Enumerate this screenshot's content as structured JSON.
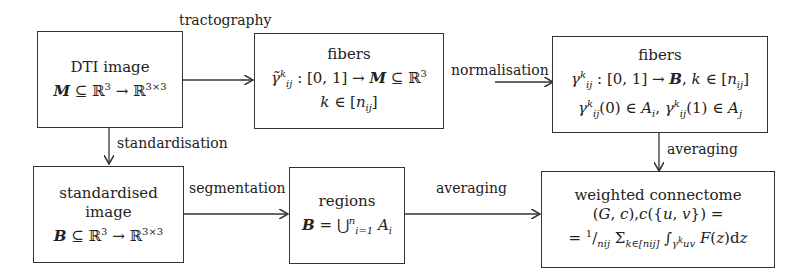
{
  "boxes": {
    "dti": {
      "title": "DTI image",
      "formula": "M ⊆ ℝ³ → ℝ³ˣ³"
    },
    "fibers_raw": {
      "title": "fibers",
      "formula1": "γ̃ᵢⱼᵏ : [0, 1] → M ⊆ ℝ³",
      "formula2": "k ∈ [nᵢⱼ]"
    },
    "fibers_norm": {
      "title": "fibers",
      "formula1": "γᵢⱼᵏ : [0, 1] → B, k ∈ [nᵢⱼ]",
      "formula2": "γᵢⱼᵏ(0) ∈ Aᵢ, γᵢⱼᵏ(1) ∈ Aⱼ"
    },
    "std_image": {
      "title": "standardised image",
      "formula": "B ⊆ ℝ³ → ℝ³ˣ³"
    },
    "regions": {
      "title": "regions",
      "formula": "B = ⋃ⁿᵢ₌₁ Aᵢ"
    },
    "connectome": {
      "title": "weighted connectome",
      "formula1": "(G, c),c({u, v}) =",
      "formula2": "= (1/nᵢⱼ) Σ_{k∈[nᵢⱼ]} ∫_{γᵤᵥᵏ} F(z)dz"
    }
  },
  "edges": {
    "tractography": "tractography",
    "normalisation": "normalisation",
    "standardisation": "standardisation",
    "segmentation": "segmentation",
    "averaging_regions": "averaging",
    "averaging_fibers": "averaging"
  }
}
